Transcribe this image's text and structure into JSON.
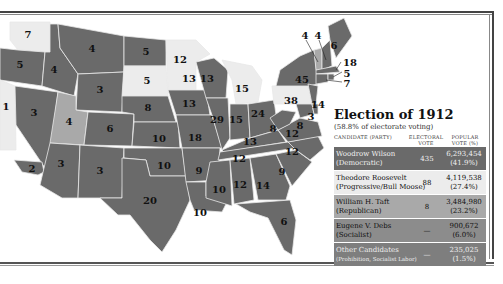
{
  "colors": {
    "democratic": "#6a6a6a",
    "progressive": "#ececec",
    "republican": "#a9a9a9",
    "socialist": "#8c8c8c",
    "other": "#7e7e7e",
    "border": "#e8e8e8"
  },
  "legend": {
    "title": "Election of 1912",
    "subtitle": "(58.8% of electorate voting)",
    "headers": {
      "candidate": "CANDIDATE (PARTY)",
      "electoral": "ELECTORAL VOTE",
      "popular": "POPULAR VOTE (%)"
    },
    "rows": [
      {
        "name": "Woodrow Wilson",
        "party": "(Democratic)",
        "electoral": "435",
        "popular": "6,293,454",
        "pct": "(41.9%)",
        "color": "#6a6a6a"
      },
      {
        "name": "Theodore Roosevelt",
        "party": "(Progressive/Bull Moose)",
        "electoral": "88",
        "popular": "4,119,538",
        "pct": "(27.4%)",
        "color": "#ececec"
      },
      {
        "name": "William H. Taft",
        "party": "(Republican)",
        "electoral": "8",
        "popular": "3,484,980",
        "pct": "(23.2%)",
        "color": "#a9a9a9"
      },
      {
        "name": "Eugene V. Debs",
        "party": "(Socialist)",
        "electoral": "—",
        "popular": "900,672",
        "pct": "(6.0%)",
        "color": "#8c8c8c"
      },
      {
        "name": "Other Candidates",
        "party": "(Prohibition, Socialist Labor)",
        "electoral": "—",
        "popular": "235,025",
        "pct": "(1.5%)",
        "color": "#7e7e7e"
      }
    ]
  },
  "states": {
    "WA": "7",
    "OR": "5",
    "CA": "2",
    "CA_N": "1",
    "ID": "4",
    "NV": "3",
    "MT": "4",
    "WY": "3",
    "UT": "4",
    "AZ": "3",
    "CO": "6",
    "NM": "3",
    "ND": "5",
    "SD": "5",
    "NE": "8",
    "KS": "10",
    "OK": "10",
    "TX": "20",
    "MN": "12",
    "IA": "13",
    "MO": "18",
    "AR": "9",
    "LA": "10",
    "WI": "13",
    "IL": "29",
    "MI": "15",
    "IN": "15",
    "OH": "24",
    "KY": "13",
    "TN": "12",
    "MS": "10",
    "AL": "12",
    "GA": "14",
    "FL": "6",
    "SC": "9",
    "NC": "12",
    "VA": "12",
    "WV": "8",
    "PA": "38",
    "NY": "45",
    "NJ": "14",
    "DE": "3",
    "MD": "8",
    "VT": "4",
    "NH": "4",
    "ME": "6",
    "MA": "18",
    "RI": "5",
    "CT": "7"
  }
}
